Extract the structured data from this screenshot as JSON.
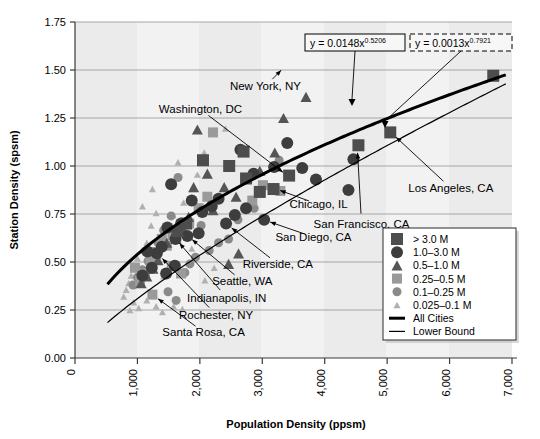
{
  "chart_data": {
    "type": "scatter",
    "title": "",
    "xlabel": "Population Density (ppsm)",
    "ylabel": "Station Density (spsm)",
    "xlim": [
      0,
      7000
    ],
    "ylim": [
      0,
      1.75
    ],
    "xticks": [
      "0",
      "1,000",
      "2,000",
      "3,000",
      "4,000",
      "5,000",
      "6,000",
      "7,000"
    ],
    "xtick_values": [
      0,
      1000,
      2000,
      3000,
      4000,
      5000,
      6000,
      7000
    ],
    "yticks": [
      "0.00",
      "0.25",
      "0.50",
      "0.75",
      "1.00",
      "1.25",
      "1.50",
      "1.75"
    ],
    "ytick_values": [
      0,
      0.25,
      0.5,
      0.75,
      1.0,
      1.25,
      1.5,
      1.75
    ],
    "grid": "horizontal",
    "legend_position": "bottom-right",
    "equations": [
      {
        "name": "all-cities-equation",
        "text": "y = 0.0148x",
        "exponent": "0.5206",
        "style": "solid-box"
      },
      {
        "name": "lower-bound-equation",
        "text": "y = 0.0013x",
        "exponent": "0.7921",
        "style": "dashed-box"
      }
    ],
    "legend": [
      {
        "label": "> 3.0 M",
        "marker": "square",
        "size": 12,
        "color": "#4d4d4d"
      },
      {
        "label": "1.0–3.0 M",
        "marker": "circle",
        "size": 12,
        "color": "#3d3d3d"
      },
      {
        "label": "0.5–1.0 M",
        "marker": "triangle",
        "size": 11,
        "color": "#555555"
      },
      {
        "label": "0.25–0.5 M",
        "marker": "square",
        "size": 10,
        "color": "#9a9a9a"
      },
      {
        "label": "0.1–0.25 M",
        "marker": "circle",
        "size": 9,
        "color": "#8a8a8a"
      },
      {
        "label": "0.025–0.1 M",
        "marker": "triangle",
        "size": 7,
        "color": "#b0b0b0"
      },
      {
        "label": "All Cities",
        "marker": "thick-line",
        "color": "#000000"
      },
      {
        "label": "Lower Bound",
        "marker": "thin-line",
        "color": "#000000"
      }
    ],
    "series": [
      {
        "name": "All Cities",
        "type": "line",
        "curve": "power",
        "coef": 0.0148,
        "exp": 0.5206,
        "stroke_width": 3
      },
      {
        "name": "Lower Bound",
        "type": "line",
        "curve": "power",
        "coef": 0.0013,
        "exp": 0.7921,
        "stroke_width": 1.2
      }
    ],
    "annotations": [
      {
        "label": "New York, NY",
        "tx": 3050,
        "ty": 1.415,
        "px": 3380,
        "py": 1.525,
        "anchor": "middle"
      },
      {
        "label": "Washington, DC",
        "tx": 2010,
        "ty": 1.295,
        "px": 3420,
        "py": 0.945,
        "anchor": "middle"
      },
      {
        "label": "Los Angeles, CA",
        "tx": 6020,
        "ty": 0.885,
        "px": 5060,
        "py": 1.175,
        "anchor": "middle"
      },
      {
        "label": "San Francisco, CA",
        "tx": 4590,
        "ty": 0.7,
        "px": 4520,
        "py": 1.105,
        "anchor": "middle"
      },
      {
        "label": "Chicago, IL",
        "tx": 3900,
        "ty": 0.8,
        "px": 3180,
        "py": 0.885,
        "anchor": "middle"
      },
      {
        "label": "San Diego, CA",
        "tx": 3820,
        "ty": 0.63,
        "px": 3020,
        "py": 0.72,
        "anchor": "middle"
      },
      {
        "label": "Riverside, CA",
        "tx": 3250,
        "ty": 0.49,
        "px": 2420,
        "py": 0.7,
        "anchor": "middle"
      },
      {
        "label": "Seattle, WA",
        "tx": 2680,
        "ty": 0.4,
        "px": 1790,
        "py": 0.64,
        "anchor": "middle"
      },
      {
        "label": "Indianapolis, IN",
        "tx": 2430,
        "ty": 0.315,
        "px": 1600,
        "py": 0.625,
        "anchor": "middle"
      },
      {
        "label": "Rochester, NY",
        "tx": 2260,
        "ty": 0.225,
        "px": 1320,
        "py": 0.545,
        "anchor": "middle"
      },
      {
        "label": "Santa Rosa, CA",
        "tx": 2060,
        "ty": 0.135,
        "px": 1240,
        "py": 0.33,
        "anchor": "middle"
      }
    ],
    "points": [
      {
        "x": 6700,
        "y": 1.47,
        "g": 0
      },
      {
        "x": 5050,
        "y": 1.175,
        "g": 0
      },
      {
        "x": 4540,
        "y": 1.108,
        "g": 0
      },
      {
        "x": 3430,
        "y": 0.95,
        "g": 0
      },
      {
        "x": 3180,
        "y": 0.88,
        "g": 0
      },
      {
        "x": 2960,
        "y": 0.865,
        "g": 0
      },
      {
        "x": 2700,
        "y": 1.075,
        "g": 0
      },
      {
        "x": 2470,
        "y": 1.0,
        "g": 0
      },
      {
        "x": 2740,
        "y": 0.935,
        "g": 0
      },
      {
        "x": 2050,
        "y": 1.03,
        "g": 0
      },
      {
        "x": 1780,
        "y": 0.7,
        "g": 0
      },
      {
        "x": 1640,
        "y": 0.66,
        "g": 0
      },
      {
        "x": 4460,
        "y": 1.035,
        "g": 1
      },
      {
        "x": 4380,
        "y": 0.875,
        "g": 1
      },
      {
        "x": 3860,
        "y": 0.93,
        "g": 1
      },
      {
        "x": 3640,
        "y": 0.99,
        "g": 1
      },
      {
        "x": 3400,
        "y": 1.12,
        "g": 1
      },
      {
        "x": 3190,
        "y": 0.995,
        "g": 1
      },
      {
        "x": 3030,
        "y": 0.72,
        "g": 1
      },
      {
        "x": 2860,
        "y": 0.96,
        "g": 1
      },
      {
        "x": 2740,
        "y": 0.78,
        "g": 1
      },
      {
        "x": 2650,
        "y": 1.085,
        "g": 1
      },
      {
        "x": 2560,
        "y": 0.745,
        "g": 1
      },
      {
        "x": 2420,
        "y": 0.7,
        "g": 1
      },
      {
        "x": 2300,
        "y": 0.83,
        "g": 1
      },
      {
        "x": 2190,
        "y": 0.79,
        "g": 1
      },
      {
        "x": 2040,
        "y": 0.76,
        "g": 1
      },
      {
        "x": 1980,
        "y": 0.65,
        "g": 1
      },
      {
        "x": 1870,
        "y": 0.82,
        "g": 1
      },
      {
        "x": 1800,
        "y": 0.635,
        "g": 1
      },
      {
        "x": 1700,
        "y": 0.7,
        "g": 1
      },
      {
        "x": 1610,
        "y": 0.62,
        "g": 1
      },
      {
        "x": 1540,
        "y": 0.905,
        "g": 1
      },
      {
        "x": 1480,
        "y": 0.68,
        "g": 1
      },
      {
        "x": 1390,
        "y": 0.58,
        "g": 1
      },
      {
        "x": 1310,
        "y": 0.545,
        "g": 1
      },
      {
        "x": 1230,
        "y": 0.47,
        "g": 1
      },
      {
        "x": 1160,
        "y": 0.555,
        "g": 1
      },
      {
        "x": 1080,
        "y": 0.43,
        "g": 1
      },
      {
        "x": 1600,
        "y": 0.48,
        "g": 1
      },
      {
        "x": 1460,
        "y": 0.44,
        "g": 1
      },
      {
        "x": 3700,
        "y": 1.36,
        "g": 2
      },
      {
        "x": 3340,
        "y": 1.25,
        "g": 2
      },
      {
        "x": 3200,
        "y": 1.07,
        "g": 2
      },
      {
        "x": 2960,
        "y": 0.975,
        "g": 2
      },
      {
        "x": 2580,
        "y": 0.84,
        "g": 2
      },
      {
        "x": 2390,
        "y": 0.89,
        "g": 2
      },
      {
        "x": 2210,
        "y": 0.77,
        "g": 2
      },
      {
        "x": 2120,
        "y": 0.96,
        "g": 2
      },
      {
        "x": 1960,
        "y": 1.19,
        "g": 2
      },
      {
        "x": 1900,
        "y": 0.89,
        "g": 2
      },
      {
        "x": 1820,
        "y": 0.735,
        "g": 2
      },
      {
        "x": 1750,
        "y": 0.66,
        "g": 2
      },
      {
        "x": 1620,
        "y": 0.62,
        "g": 2
      },
      {
        "x": 1470,
        "y": 0.6,
        "g": 2
      },
      {
        "x": 1330,
        "y": 0.51,
        "g": 2
      },
      {
        "x": 1250,
        "y": 0.465,
        "g": 2
      },
      {
        "x": 1150,
        "y": 0.425,
        "g": 2
      },
      {
        "x": 1060,
        "y": 0.39,
        "g": 2
      },
      {
        "x": 2620,
        "y": 0.545,
        "g": 2
      },
      {
        "x": 2460,
        "y": 0.49,
        "g": 2
      },
      {
        "x": 3290,
        "y": 0.87,
        "g": 3
      },
      {
        "x": 3010,
        "y": 0.9,
        "g": 3
      },
      {
        "x": 2840,
        "y": 0.82,
        "g": 3
      },
      {
        "x": 2210,
        "y": 1.175,
        "g": 3
      },
      {
        "x": 2120,
        "y": 0.84,
        "g": 3
      },
      {
        "x": 1980,
        "y": 0.78,
        "g": 3
      },
      {
        "x": 1830,
        "y": 0.7,
        "g": 3
      },
      {
        "x": 1700,
        "y": 0.66,
        "g": 3
      },
      {
        "x": 1560,
        "y": 0.64,
        "g": 3
      },
      {
        "x": 1470,
        "y": 0.585,
        "g": 3
      },
      {
        "x": 1390,
        "y": 0.62,
        "g": 3
      },
      {
        "x": 1300,
        "y": 0.54,
        "g": 3
      },
      {
        "x": 1210,
        "y": 0.51,
        "g": 3
      },
      {
        "x": 1120,
        "y": 0.44,
        "g": 3
      },
      {
        "x": 1040,
        "y": 0.4,
        "g": 3
      },
      {
        "x": 1240,
        "y": 0.33,
        "g": 3
      },
      {
        "x": 1550,
        "y": 0.48,
        "g": 3
      },
      {
        "x": 1700,
        "y": 0.44,
        "g": 3
      },
      {
        "x": 960,
        "y": 0.47,
        "g": 3
      },
      {
        "x": 3270,
        "y": 1.03,
        "g": 4
      },
      {
        "x": 2870,
        "y": 0.78,
        "g": 4
      },
      {
        "x": 2610,
        "y": 0.72,
        "g": 4
      },
      {
        "x": 2460,
        "y": 0.62,
        "g": 4
      },
      {
        "x": 2300,
        "y": 0.6,
        "g": 4
      },
      {
        "x": 2150,
        "y": 0.56,
        "g": 4
      },
      {
        "x": 2020,
        "y": 0.69,
        "g": 4
      },
      {
        "x": 1930,
        "y": 0.525,
        "g": 4
      },
      {
        "x": 1840,
        "y": 0.49,
        "g": 4
      },
      {
        "x": 1760,
        "y": 0.445,
        "g": 4
      },
      {
        "x": 1650,
        "y": 0.94,
        "g": 4
      },
      {
        "x": 1540,
        "y": 0.74,
        "g": 4
      },
      {
        "x": 1420,
        "y": 0.665,
        "g": 4
      },
      {
        "x": 1330,
        "y": 0.6,
        "g": 4
      },
      {
        "x": 1250,
        "y": 0.555,
        "g": 4
      },
      {
        "x": 1170,
        "y": 0.505,
        "g": 4
      },
      {
        "x": 1080,
        "y": 0.46,
        "g": 4
      },
      {
        "x": 1000,
        "y": 0.42,
        "g": 4
      },
      {
        "x": 930,
        "y": 0.38,
        "g": 4
      },
      {
        "x": 1490,
        "y": 0.345,
        "g": 4
      },
      {
        "x": 1620,
        "y": 0.3,
        "g": 4
      },
      {
        "x": 2410,
        "y": 1.195,
        "g": 5
      },
      {
        "x": 2070,
        "y": 1.07,
        "g": 5
      },
      {
        "x": 1960,
        "y": 0.955,
        "g": 5
      },
      {
        "x": 1880,
        "y": 0.88,
        "g": 5
      },
      {
        "x": 1740,
        "y": 0.81,
        "g": 5
      },
      {
        "x": 1690,
        "y": 0.705,
        "g": 5
      },
      {
        "x": 1570,
        "y": 0.745,
        "g": 5
      },
      {
        "x": 1460,
        "y": 0.69,
        "g": 5
      },
      {
        "x": 1380,
        "y": 0.64,
        "g": 5
      },
      {
        "x": 1300,
        "y": 0.755,
        "g": 5
      },
      {
        "x": 1220,
        "y": 0.69,
        "g": 5
      },
      {
        "x": 1150,
        "y": 0.6,
        "g": 5
      },
      {
        "x": 1070,
        "y": 0.56,
        "g": 5
      },
      {
        "x": 1000,
        "y": 0.52,
        "g": 5
      },
      {
        "x": 950,
        "y": 0.47,
        "g": 5
      },
      {
        "x": 900,
        "y": 0.43,
        "g": 5
      },
      {
        "x": 860,
        "y": 0.39,
        "g": 5
      },
      {
        "x": 820,
        "y": 0.355,
        "g": 5
      },
      {
        "x": 780,
        "y": 0.32,
        "g": 5
      },
      {
        "x": 1080,
        "y": 0.79,
        "g": 5
      },
      {
        "x": 1150,
        "y": 0.3,
        "g": 5
      },
      {
        "x": 1300,
        "y": 0.27,
        "g": 5
      },
      {
        "x": 1400,
        "y": 0.24,
        "g": 5
      },
      {
        "x": 1020,
        "y": 0.26,
        "g": 5
      },
      {
        "x": 940,
        "y": 0.29,
        "g": 5
      },
      {
        "x": 880,
        "y": 0.25,
        "g": 5
      },
      {
        "x": 1580,
        "y": 0.27,
        "g": 5
      },
      {
        "x": 1720,
        "y": 0.255,
        "g": 5
      },
      {
        "x": 1240,
        "y": 0.88,
        "g": 5
      },
      {
        "x": 1650,
        "y": 1.02,
        "g": 5
      },
      {
        "x": 1870,
        "y": 0.57,
        "g": 5
      },
      {
        "x": 1420,
        "y": 0.425,
        "g": 5
      },
      {
        "x": 2230,
        "y": 0.47,
        "g": 5
      },
      {
        "x": 2080,
        "y": 0.405,
        "g": 5
      }
    ]
  }
}
